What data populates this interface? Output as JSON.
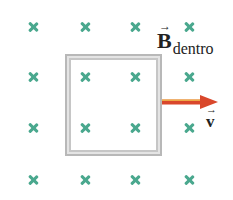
{
  "diagram": {
    "field": {
      "symbol": "B",
      "vector_mark": "→",
      "subscript": "dentro",
      "direction": "into-page",
      "marker_icon": "cross-icon",
      "marker_color": "#4aa88e",
      "grid": {
        "columns_x": [
          33,
          85,
          135,
          189
        ],
        "rows_y": [
          27,
          77,
          128,
          180
        ]
      }
    },
    "loop": {
      "shape": "square",
      "border_color": "#b8b8b8",
      "left": 65,
      "top": 54,
      "right": 162,
      "bottom": 156
    },
    "velocity": {
      "symbol": "v",
      "vector_mark": "→",
      "direction": "right",
      "arrow_color": "#d9472b",
      "highlight_color": "#f2c14e"
    }
  }
}
